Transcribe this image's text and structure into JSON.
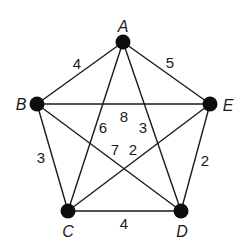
{
  "diagram": {
    "type": "weighted-complete-graph",
    "nodes": [
      {
        "id": "A",
        "label": "A",
        "x": 123,
        "y": 42,
        "label_x": 123,
        "label_y": 32
      },
      {
        "id": "B",
        "label": "B",
        "x": 37,
        "y": 104,
        "label_x": 21,
        "label_y": 110
      },
      {
        "id": "E",
        "label": "E",
        "x": 210,
        "y": 104,
        "label_x": 228,
        "label_y": 111
      },
      {
        "id": "C",
        "label": "C",
        "x": 68,
        "y": 211,
        "label_x": 68,
        "label_y": 237
      },
      {
        "id": "D",
        "label": "D",
        "x": 181,
        "y": 211,
        "label_x": 182,
        "label_y": 237
      }
    ],
    "edges": [
      {
        "from": "A",
        "to": "B",
        "weight": "4",
        "label_x": 77,
        "label_y": 69
      },
      {
        "from": "A",
        "to": "E",
        "weight": "5",
        "label_x": 170,
        "label_y": 68
      },
      {
        "from": "B",
        "to": "E",
        "weight": "8",
        "label_x": 124,
        "label_y": 122
      },
      {
        "from": "A",
        "to": "C",
        "weight": "6",
        "label_x": 103,
        "label_y": 133
      },
      {
        "from": "A",
        "to": "D",
        "weight": "3",
        "label_x": 143,
        "label_y": 133
      },
      {
        "from": "B",
        "to": "C",
        "weight": "3",
        "label_x": 41,
        "label_y": 163
      },
      {
        "from": "B",
        "to": "D",
        "weight": "7",
        "label_x": 115,
        "label_y": 155
      },
      {
        "from": "C",
        "to": "E",
        "weight": "2",
        "label_x": 133,
        "label_y": 155
      },
      {
        "from": "E",
        "to": "D",
        "weight": "2",
        "label_x": 205,
        "label_y": 166
      },
      {
        "from": "C",
        "to": "D",
        "weight": "4",
        "label_x": 124,
        "label_y": 229
      }
    ]
  }
}
